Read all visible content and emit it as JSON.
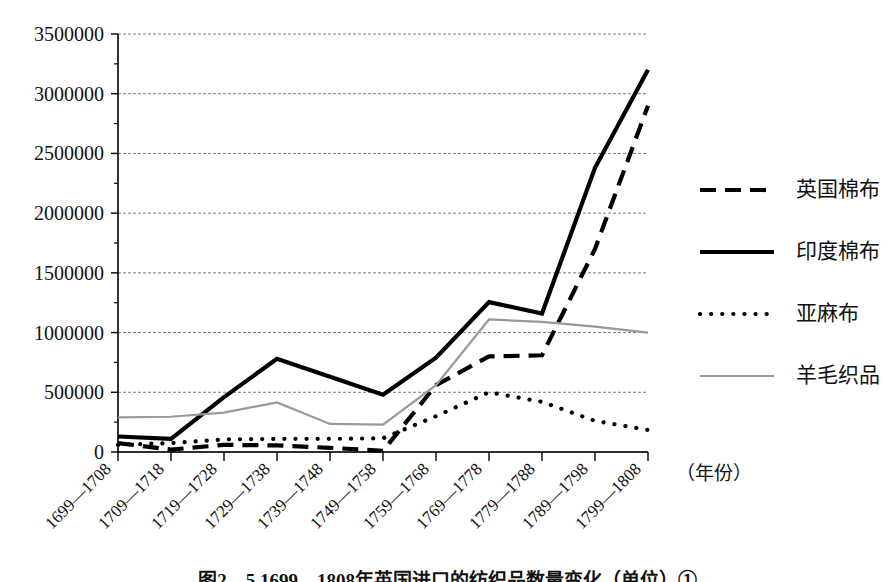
{
  "figure": {
    "caption": "图2—5  1699—1808年英国进口的纺织品数量变化（单位）①",
    "x_axis_caption": "（年份）"
  },
  "chart_data": {
    "type": "line",
    "title": "",
    "xlabel": "（年份）",
    "ylabel": "",
    "ylim": [
      0,
      3500000
    ],
    "ytick_labels": [
      "3500000",
      "3000000",
      "2500000",
      "2000000",
      "1500000",
      "1000000",
      "500000",
      "0"
    ],
    "ytick_values": [
      3500000,
      3000000,
      2500000,
      2000000,
      1500000,
      1000000,
      500000,
      0
    ],
    "grid": true,
    "legend_position": "right",
    "categories": [
      "1699—1708",
      "1709—1718",
      "1719—1728",
      "1729—1738",
      "1739—1748",
      "1749—1758",
      "1759—1768",
      "1769—1778",
      "1779—1788",
      "1789—1798",
      "1799—1808"
    ],
    "series": [
      {
        "name": "英国棉布",
        "style": "dashed",
        "color": "#000000",
        "values": [
          75000,
          20000,
          60000,
          55000,
          35000,
          10000,
          560000,
          800000,
          810000,
          1700000,
          2900000
        ]
      },
      {
        "name": "印度棉布",
        "style": "solid",
        "color": "#000000",
        "values": [
          130000,
          110000,
          460000,
          780000,
          630000,
          480000,
          790000,
          1255000,
          1160000,
          2380000,
          3200000
        ]
      },
      {
        "name": "亚麻布",
        "style": "dotted",
        "color": "#000000",
        "values": [
          60000,
          75000,
          105000,
          110000,
          110000,
          115000,
          300000,
          500000,
          420000,
          260000,
          185000
        ]
      },
      {
        "name": "羊毛织品",
        "style": "solid",
        "color": "#999999",
        "values": [
          290000,
          295000,
          330000,
          415000,
          235000,
          230000,
          560000,
          1110000,
          1090000,
          1050000,
          1000000
        ]
      }
    ]
  }
}
